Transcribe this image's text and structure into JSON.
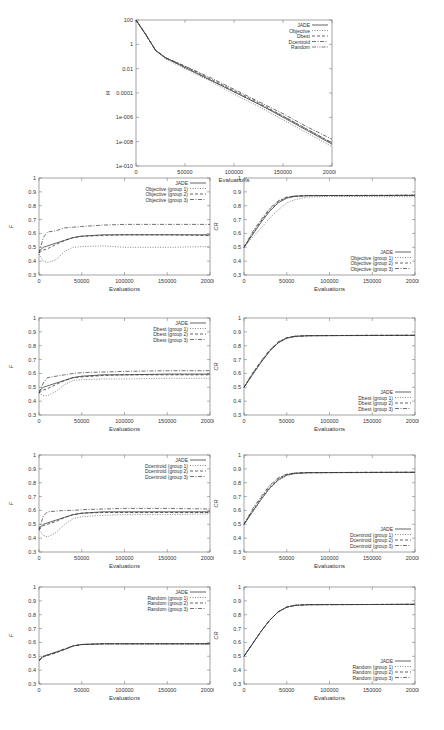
{
  "chart_data": [
    {
      "id": "top",
      "type": "line",
      "title": "",
      "xlabel": "Evaluations",
      "ylabel": "f4",
      "yscale": "log",
      "xlim": [
        0,
        200000
      ],
      "ylim_log10": [
        -10,
        2
      ],
      "xticks": [
        "0",
        "50000",
        "100000",
        "150000",
        "200000"
      ],
      "yticks": [
        "100",
        "1",
        "0.01",
        "0.0001",
        "1e-006",
        "1e-008",
        "1e-010"
      ],
      "legend_position": "top-right",
      "grid": false,
      "x": [
        0,
        10000,
        20000,
        30000,
        50000,
        75000,
        100000,
        125000,
        150000,
        175000,
        200000
      ],
      "series": [
        {
          "name": "JADE",
          "style": "solid",
          "log10": [
            2,
            0.8,
            -0.5,
            -1.1,
            -1.9,
            -2.9,
            -3.9,
            -4.9,
            -6.0,
            -7.1,
            -8.2
          ]
        },
        {
          "name": "Objective",
          "style": "dotted",
          "log10": [
            2,
            0.8,
            -0.5,
            -1.2,
            -2.0,
            -3.0,
            -4.1,
            -5.1,
            -6.2,
            -7.3,
            -8.4
          ]
        },
        {
          "name": "Dbest",
          "style": "dashed",
          "log10": [
            2,
            0.8,
            -0.5,
            -1.1,
            -1.8,
            -2.8,
            -3.8,
            -4.8,
            -5.9,
            -7.0,
            -8.1
          ]
        },
        {
          "name": "Dcentroid",
          "style": "dashdot",
          "log10": [
            2,
            0.8,
            -0.5,
            -1.1,
            -1.8,
            -2.7,
            -3.7,
            -4.7,
            -5.7,
            -6.8,
            -7.8
          ]
        },
        {
          "name": "Random",
          "style": "dashdotdot",
          "log10": [
            2,
            0.8,
            -0.5,
            -1.1,
            -1.9,
            -2.9,
            -3.9,
            -4.9,
            -5.9,
            -7.0,
            -8.1
          ]
        }
      ]
    },
    {
      "id": "objective-F",
      "type": "line",
      "xlabel": "Evaluations",
      "ylabel": "F",
      "xlim": [
        0,
        200000
      ],
      "ylim": [
        0.3,
        1
      ],
      "xticks": [
        "0",
        "50000",
        "100000",
        "150000",
        "200000"
      ],
      "yticks": [
        "0.3",
        "0.4",
        "0.5",
        "0.6",
        "0.7",
        "0.8",
        "0.9",
        "1"
      ],
      "legend_position": "top-right",
      "x": [
        0,
        5000,
        10000,
        20000,
        30000,
        40000,
        50000,
        75000,
        100000,
        150000,
        200000
      ],
      "series": [
        {
          "name": "JADE",
          "style": "solid",
          "values": [
            0.47,
            0.5,
            0.51,
            0.53,
            0.55,
            0.57,
            0.58,
            0.59,
            0.59,
            0.59,
            0.59
          ]
        },
        {
          "name": "Objective (group 1)",
          "style": "dotted",
          "values": [
            0.45,
            0.4,
            0.39,
            0.41,
            0.47,
            0.5,
            0.505,
            0.51,
            0.5,
            0.5,
            0.505
          ]
        },
        {
          "name": "Objective (group 2)",
          "style": "dashed",
          "values": [
            0.46,
            0.48,
            0.49,
            0.52,
            0.55,
            0.57,
            0.58,
            0.585,
            0.59,
            0.59,
            0.585
          ]
        },
        {
          "name": "Objective (group 3)",
          "style": "dashdot",
          "values": [
            0.46,
            0.57,
            0.61,
            0.62,
            0.64,
            0.645,
            0.65,
            0.66,
            0.665,
            0.665,
            0.665
          ]
        }
      ]
    },
    {
      "id": "objective-CR",
      "type": "line",
      "xlabel": "Evaluations",
      "ylabel": "CR",
      "xlim": [
        0,
        200000
      ],
      "ylim": [
        0.3,
        1
      ],
      "xticks": [
        "0",
        "50000",
        "100000",
        "150000",
        "200000"
      ],
      "yticks": [
        "0.3",
        "0.4",
        "0.5",
        "0.6",
        "0.7",
        "0.8",
        "0.9",
        "1"
      ],
      "legend_position": "bottom-right",
      "x": [
        0,
        10000,
        20000,
        30000,
        40000,
        50000,
        60000,
        75000,
        100000,
        150000,
        200000
      ],
      "series": [
        {
          "name": "JADE",
          "style": "solid",
          "values": [
            0.5,
            0.59,
            0.68,
            0.76,
            0.82,
            0.855,
            0.868,
            0.872,
            0.873,
            0.873,
            0.875
          ]
        },
        {
          "name": "Objective (group 1)",
          "style": "dotted",
          "values": [
            0.5,
            0.57,
            0.64,
            0.71,
            0.77,
            0.82,
            0.845,
            0.862,
            0.868,
            0.866,
            0.865
          ]
        },
        {
          "name": "Objective (group 2)",
          "style": "dashed",
          "values": [
            0.5,
            0.6,
            0.69,
            0.77,
            0.83,
            0.86,
            0.87,
            0.873,
            0.873,
            0.874,
            0.875
          ]
        },
        {
          "name": "Objective (group 3)",
          "style": "dashdot",
          "values": [
            0.5,
            0.61,
            0.7,
            0.78,
            0.835,
            0.862,
            0.87,
            0.873,
            0.874,
            0.875,
            0.876
          ]
        }
      ]
    },
    {
      "id": "dbest-F",
      "type": "line",
      "xlabel": "Evaluations",
      "ylabel": "F",
      "xlim": [
        0,
        200000
      ],
      "ylim": [
        0.3,
        1
      ],
      "xticks": [
        "0",
        "50000",
        "100000",
        "150000",
        "200000"
      ],
      "yticks": [
        "0.3",
        "0.4",
        "0.5",
        "0.6",
        "0.7",
        "0.8",
        "0.9",
        "1"
      ],
      "legend_position": "top-right",
      "x": [
        0,
        5000,
        10000,
        20000,
        30000,
        40000,
        50000,
        75000,
        100000,
        150000,
        200000
      ],
      "series": [
        {
          "name": "JADE",
          "style": "solid",
          "values": [
            0.47,
            0.5,
            0.51,
            0.53,
            0.55,
            0.57,
            0.58,
            0.59,
            0.59,
            0.595,
            0.595
          ]
        },
        {
          "name": "Dbest (group 1)",
          "style": "dotted",
          "values": [
            0.46,
            0.44,
            0.44,
            0.47,
            0.52,
            0.55,
            0.555,
            0.56,
            0.56,
            0.565,
            0.565
          ]
        },
        {
          "name": "Dbest (group 2)",
          "style": "dashed",
          "values": [
            0.46,
            0.48,
            0.49,
            0.52,
            0.55,
            0.57,
            0.575,
            0.585,
            0.59,
            0.59,
            0.59
          ]
        },
        {
          "name": "Dbest (group 3)",
          "style": "dashdot",
          "values": [
            0.46,
            0.53,
            0.57,
            0.58,
            0.59,
            0.6,
            0.605,
            0.61,
            0.615,
            0.62,
            0.62
          ]
        }
      ]
    },
    {
      "id": "dbest-CR",
      "type": "line",
      "xlabel": "Evaluations",
      "ylabel": "CR",
      "xlim": [
        0,
        200000
      ],
      "ylim": [
        0.3,
        1
      ],
      "xticks": [
        "0",
        "50000",
        "100000",
        "150000",
        "200000"
      ],
      "yticks": [
        "0.3",
        "0.4",
        "0.5",
        "0.6",
        "0.7",
        "0.8",
        "0.9",
        "1"
      ],
      "legend_position": "bottom-right",
      "x": [
        0,
        10000,
        20000,
        30000,
        40000,
        50000,
        60000,
        75000,
        100000,
        150000,
        200000
      ],
      "series": [
        {
          "name": "JADE",
          "style": "solid",
          "values": [
            0.5,
            0.59,
            0.68,
            0.76,
            0.82,
            0.855,
            0.868,
            0.872,
            0.873,
            0.874,
            0.875
          ]
        },
        {
          "name": "Dbest (group 1)",
          "style": "dotted",
          "values": [
            0.5,
            0.59,
            0.68,
            0.76,
            0.82,
            0.853,
            0.866,
            0.871,
            0.873,
            0.874,
            0.874
          ]
        },
        {
          "name": "Dbest (group 2)",
          "style": "dashed",
          "values": [
            0.5,
            0.6,
            0.685,
            0.765,
            0.825,
            0.857,
            0.868,
            0.872,
            0.873,
            0.875,
            0.875
          ]
        },
        {
          "name": "Dbest (group 3)",
          "style": "dashdot",
          "values": [
            0.5,
            0.6,
            0.69,
            0.77,
            0.828,
            0.858,
            0.869,
            0.872,
            0.873,
            0.875,
            0.875
          ]
        }
      ]
    },
    {
      "id": "dcentroid-F",
      "type": "line",
      "xlabel": "Evaluations",
      "ylabel": "F",
      "xlim": [
        0,
        200000
      ],
      "ylim": [
        0.3,
        1
      ],
      "xticks": [
        "0",
        "50000",
        "100000",
        "150000",
        "200000"
      ],
      "yticks": [
        "0.3",
        "0.4",
        "0.5",
        "0.6",
        "0.7",
        "0.8",
        "0.9",
        "1"
      ],
      "legend_position": "top-right",
      "x": [
        0,
        5000,
        10000,
        20000,
        30000,
        40000,
        50000,
        75000,
        100000,
        150000,
        200000
      ],
      "series": [
        {
          "name": "JADE",
          "style": "solid",
          "values": [
            0.47,
            0.5,
            0.51,
            0.53,
            0.55,
            0.57,
            0.58,
            0.59,
            0.59,
            0.59,
            0.59
          ]
        },
        {
          "name": "Dcentroid (group 1)",
          "style": "dotted",
          "values": [
            0.46,
            0.42,
            0.41,
            0.44,
            0.5,
            0.54,
            0.555,
            0.565,
            0.57,
            0.57,
            0.575
          ]
        },
        {
          "name": "Dcentroid (group 2)",
          "style": "dashed",
          "values": [
            0.46,
            0.49,
            0.5,
            0.52,
            0.55,
            0.57,
            0.58,
            0.585,
            0.585,
            0.585,
            0.585
          ]
        },
        {
          "name": "Dcentroid (group 3)",
          "style": "dashdot",
          "values": [
            0.46,
            0.56,
            0.59,
            0.595,
            0.6,
            0.6,
            0.605,
            0.61,
            0.615,
            0.615,
            0.61
          ]
        }
      ]
    },
    {
      "id": "dcentroid-CR",
      "type": "line",
      "xlabel": "Evaluations",
      "ylabel": "CR",
      "xlim": [
        0,
        200000
      ],
      "ylim": [
        0.3,
        1
      ],
      "xticks": [
        "0",
        "50000",
        "100000",
        "150000",
        "200000"
      ],
      "yticks": [
        "0.3",
        "0.4",
        "0.5",
        "0.6",
        "0.7",
        "0.8",
        "0.9",
        "1"
      ],
      "legend_position": "bottom-right",
      "x": [
        0,
        10000,
        20000,
        30000,
        40000,
        50000,
        60000,
        75000,
        100000,
        150000,
        200000
      ],
      "series": [
        {
          "name": "JADE",
          "style": "solid",
          "values": [
            0.5,
            0.59,
            0.68,
            0.76,
            0.82,
            0.855,
            0.868,
            0.872,
            0.873,
            0.874,
            0.875
          ]
        },
        {
          "name": "Dcentroid (group 1)",
          "style": "dotted",
          "values": [
            0.5,
            0.585,
            0.675,
            0.755,
            0.815,
            0.852,
            0.866,
            0.871,
            0.872,
            0.873,
            0.874
          ]
        },
        {
          "name": "Dcentroid (group 2)",
          "style": "dashed",
          "values": [
            0.5,
            0.6,
            0.69,
            0.77,
            0.83,
            0.86,
            0.869,
            0.872,
            0.873,
            0.875,
            0.875
          ]
        },
        {
          "name": "Dcentroid (group 3)",
          "style": "dashdot",
          "values": [
            0.5,
            0.61,
            0.7,
            0.78,
            0.835,
            0.862,
            0.87,
            0.873,
            0.874,
            0.875,
            0.876
          ]
        }
      ]
    },
    {
      "id": "random-F",
      "type": "line",
      "xlabel": "Evaluations",
      "ylabel": "F",
      "xlim": [
        0,
        200000
      ],
      "ylim": [
        0.3,
        1
      ],
      "xticks": [
        "0",
        "50000",
        "100000",
        "150000",
        "200000"
      ],
      "yticks": [
        "0.3",
        "0.4",
        "0.5",
        "0.6",
        "0.7",
        "0.8",
        "0.9",
        "1"
      ],
      "legend_position": "top-right",
      "x": [
        0,
        5000,
        10000,
        20000,
        30000,
        40000,
        50000,
        75000,
        100000,
        150000,
        200000
      ],
      "series": [
        {
          "name": "JADE",
          "style": "solid",
          "values": [
            0.47,
            0.5,
            0.51,
            0.53,
            0.55,
            0.575,
            0.585,
            0.59,
            0.59,
            0.59,
            0.59
          ]
        },
        {
          "name": "Random (group 1)",
          "style": "dotted",
          "values": [
            0.47,
            0.5,
            0.51,
            0.525,
            0.55,
            0.575,
            0.585,
            0.59,
            0.59,
            0.59,
            0.59
          ]
        },
        {
          "name": "Random (group 2)",
          "style": "dashed",
          "values": [
            0.47,
            0.495,
            0.505,
            0.525,
            0.55,
            0.575,
            0.585,
            0.59,
            0.59,
            0.59,
            0.59
          ]
        },
        {
          "name": "Random (group 3)",
          "style": "dashdot",
          "values": [
            0.47,
            0.5,
            0.51,
            0.53,
            0.555,
            0.575,
            0.585,
            0.59,
            0.59,
            0.59,
            0.59
          ]
        }
      ]
    },
    {
      "id": "random-CR",
      "type": "line",
      "xlabel": "Evaluations",
      "ylabel": "CR",
      "xlim": [
        0,
        200000
      ],
      "ylim": [
        0.3,
        1
      ],
      "xticks": [
        "0",
        "50000",
        "100000",
        "150000",
        "200000"
      ],
      "yticks": [
        "0.3",
        "0.4",
        "0.5",
        "0.6",
        "0.7",
        "0.8",
        "0.9",
        "1"
      ],
      "legend_position": "bottom-right",
      "x": [
        0,
        10000,
        20000,
        30000,
        40000,
        50000,
        60000,
        75000,
        100000,
        150000,
        200000
      ],
      "series": [
        {
          "name": "JADE",
          "style": "solid",
          "values": [
            0.5,
            0.59,
            0.68,
            0.76,
            0.82,
            0.855,
            0.868,
            0.872,
            0.873,
            0.874,
            0.875
          ]
        },
        {
          "name": "Random (group 1)",
          "style": "dotted",
          "values": [
            0.5,
            0.59,
            0.68,
            0.76,
            0.82,
            0.855,
            0.868,
            0.872,
            0.873,
            0.874,
            0.875
          ]
        },
        {
          "name": "Random (group 2)",
          "style": "dashed",
          "values": [
            0.5,
            0.59,
            0.68,
            0.76,
            0.82,
            0.855,
            0.868,
            0.872,
            0.873,
            0.874,
            0.875
          ]
        },
        {
          "name": "Random (group 3)",
          "style": "dashdot",
          "values": [
            0.5,
            0.59,
            0.68,
            0.76,
            0.82,
            0.855,
            0.868,
            0.872,
            0.873,
            0.874,
            0.875
          ]
        }
      ]
    }
  ],
  "layout": {
    "top": {
      "left": 136,
      "top": 20,
      "width": 196,
      "height": 146
    },
    "grid": {
      "col_left": [
        39,
        244
      ],
      "plot_width": 171,
      "row_top": [
        178,
        318,
        455,
        587
      ],
      "plot_height": 97
    }
  }
}
